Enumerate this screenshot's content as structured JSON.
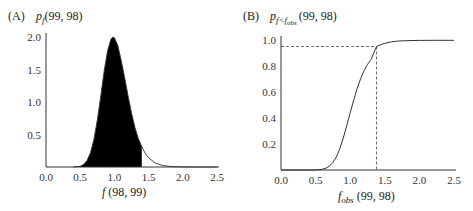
{
  "chart_data": [
    {
      "panel": "(A)",
      "type": "area",
      "title": "",
      "ylabel_main": "p",
      "ylabel_sub": "f",
      "ylabel_args": "(99, 98)",
      "xlabel_main": "f",
      "xlabel_args": " (98, 99)",
      "xlim": [
        0,
        2.5
      ],
      "ylim": [
        0,
        2.0
      ],
      "xticks": [
        "0.0",
        "0.5",
        "1.0",
        "1.5",
        "2.0",
        "2.5"
      ],
      "xtick_values": [
        0,
        0.5,
        1.0,
        1.5,
        2.0,
        2.5
      ],
      "yticks": [
        "0.5",
        "1.0",
        "1.5",
        "2.0"
      ],
      "ytick_values": [
        0.5,
        1.0,
        1.5,
        2.0
      ],
      "shaded_upto": 1.4,
      "x": [
        0.4,
        0.5,
        0.55,
        0.6,
        0.65,
        0.7,
        0.75,
        0.8,
        0.85,
        0.9,
        0.95,
        0.98,
        1.0,
        1.05,
        1.1,
        1.15,
        1.2,
        1.25,
        1.3,
        1.35,
        1.4,
        1.45,
        1.5,
        1.6,
        1.7,
        1.8,
        1.9,
        2.0,
        2.2,
        2.5
      ],
      "y": [
        0.0,
        0.01,
        0.04,
        0.1,
        0.22,
        0.42,
        0.72,
        1.08,
        1.47,
        1.79,
        1.97,
        2.0,
        1.99,
        1.87,
        1.64,
        1.37,
        1.09,
        0.83,
        0.61,
        0.44,
        0.31,
        0.21,
        0.14,
        0.06,
        0.025,
        0.01,
        0.004,
        0.002,
        0.0,
        0.0
      ],
      "grid": false
    },
    {
      "panel": "(B)",
      "type": "line",
      "title": "",
      "ylabel_main": "p",
      "ylabel_sub": "f<f",
      "ylabel_subsub": "obs",
      "ylabel_args": "(99, 98)",
      "xlabel_main": "f",
      "xlabel_sub": "obs",
      "xlabel_args": " (99, 98)",
      "xlim": [
        0,
        2.5
      ],
      "ylim": [
        0,
        1.0
      ],
      "xticks": [
        "0.0",
        "0.5",
        "1.0",
        "1.5",
        "2.0",
        "2.5"
      ],
      "xtick_values": [
        0,
        0.5,
        1.0,
        1.5,
        2.0,
        2.5
      ],
      "yticks": [
        "0.2",
        "0.4",
        "0.6",
        "0.8",
        "1.0"
      ],
      "ytick_values": [
        0.2,
        0.4,
        0.6,
        0.8,
        1.0
      ],
      "reference_x": 1.38,
      "reference_y": 0.95,
      "x": [
        0.0,
        0.5,
        0.55,
        0.6,
        0.65,
        0.7,
        0.75,
        0.8,
        0.85,
        0.9,
        0.95,
        1.0,
        1.05,
        1.1,
        1.15,
        1.2,
        1.25,
        1.3,
        1.38,
        1.45,
        1.5,
        1.6,
        1.7,
        1.8,
        2.0,
        2.2,
        2.5
      ],
      "y": [
        0.0,
        0.0,
        0.002,
        0.006,
        0.014,
        0.03,
        0.058,
        0.101,
        0.165,
        0.246,
        0.34,
        0.44,
        0.538,
        0.626,
        0.702,
        0.763,
        0.812,
        0.85,
        0.95,
        0.965,
        0.975,
        0.986,
        0.992,
        0.995,
        0.997,
        0.998,
        0.998
      ],
      "grid": false
    }
  ]
}
